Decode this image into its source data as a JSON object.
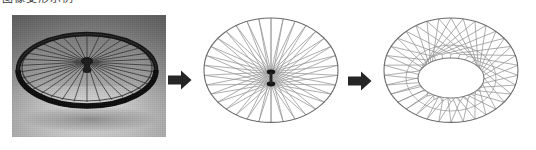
{
  "figure": {
    "caption_sliver": "图像变形示例",
    "background_color": "#ffffff",
    "width": 536,
    "height": 150
  },
  "panels": [
    {
      "id": "photo",
      "name": "bicycle-wheel-photograph",
      "kind": "photograph",
      "subject": "bicycle wheel",
      "palette": "grayscale",
      "bounds": {
        "x": 12,
        "y": 15,
        "width": 154,
        "height": 122
      },
      "rim_color": "#1d1d1d",
      "spoke_color": "#2a2a2a",
      "background_color": "#9a9a9a",
      "spoke_count": 36
    },
    {
      "id": "spoked-wheel",
      "name": "spoked-wheel-wireframe",
      "kind": "line-diagram",
      "description": "wheel wireframe with spokes converging at the hub",
      "bounds": {
        "x": 192,
        "y": 8,
        "width": 158,
        "height": 142
      },
      "rim_color": "#6b6b6b",
      "spoke_color": "#8a8a8a",
      "hub_color": "#141414",
      "spoke_count": 36,
      "hub_flanges": 2
    },
    {
      "id": "annulus-wheel",
      "name": "annulus-wheel-wireframe",
      "kind": "line-diagram",
      "description": "wheel wireframe with hub expanded into an elliptical hole, spokes span the ring",
      "bounds": {
        "x": 372,
        "y": 8,
        "width": 158,
        "height": 142
      },
      "rim_color": "#6b6b6b",
      "spoke_color": "#8a8a8a",
      "inner_ring_color": "#7a7a7a",
      "spoke_count": 36,
      "inner_hole": {
        "cx": 79,
        "cy": 73,
        "rx": 33,
        "ry": 20
      }
    }
  ],
  "arrows": [
    {
      "id": "arrow-1",
      "name": "transform-arrow-photo-to-wireframe",
      "direction": "right",
      "color": "#252525",
      "bounds": {
        "x": 168,
        "y": 70,
        "width": 24,
        "height": 20
      }
    },
    {
      "id": "arrow-2",
      "name": "transform-arrow-wireframe-to-annulus",
      "direction": "right",
      "color": "#252525",
      "bounds": {
        "x": 348,
        "y": 71,
        "width": 24,
        "height": 20
      }
    }
  ]
}
